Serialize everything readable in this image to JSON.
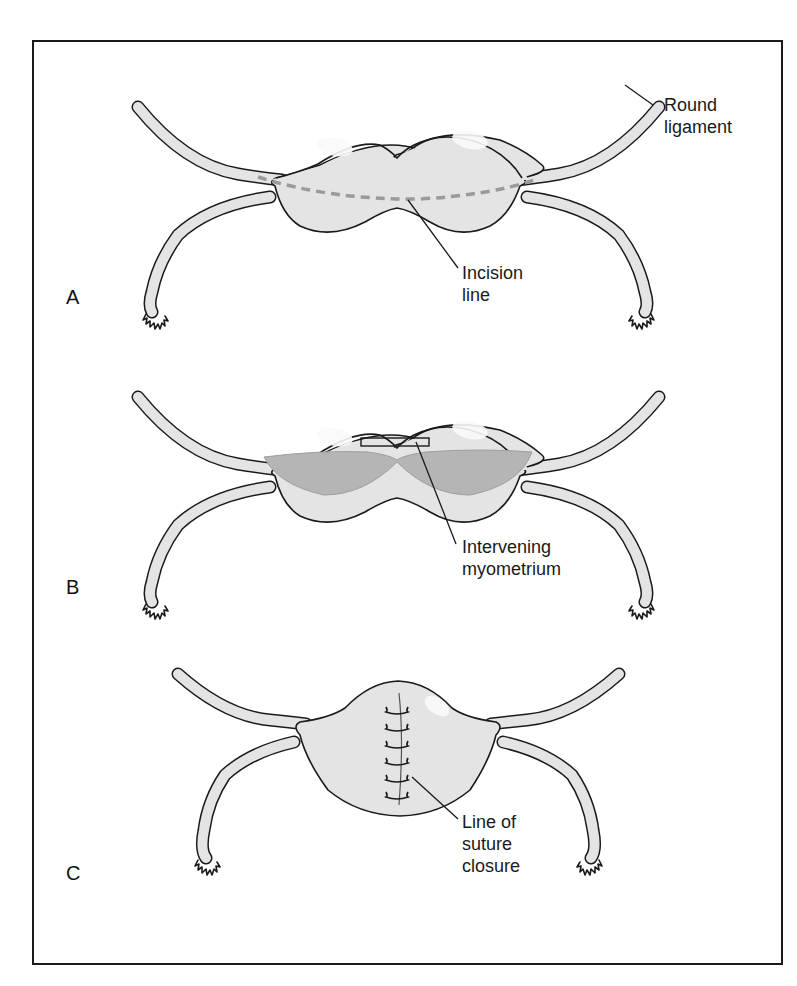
{
  "figure": {
    "panels": [
      {
        "id": "A",
        "letter": "A",
        "labels": [
          {
            "line1": "Round",
            "line2": "ligament"
          },
          {
            "line1": "Incision",
            "line2": "line"
          }
        ]
      },
      {
        "id": "B",
        "letter": "B",
        "labels": [
          {
            "line1": "Intervening",
            "line2": "myometrium"
          }
        ]
      },
      {
        "id": "C",
        "letter": "C",
        "labels": [
          {
            "line1": "Line of",
            "line2": "suture",
            "line3": "closure"
          }
        ]
      }
    ],
    "colors": {
      "tissue_fill": "#e4e4e4",
      "cavity_fill": "#b5b5b5",
      "incision_dash": "#9a9a9a",
      "outline": "#1a1a1a"
    }
  }
}
